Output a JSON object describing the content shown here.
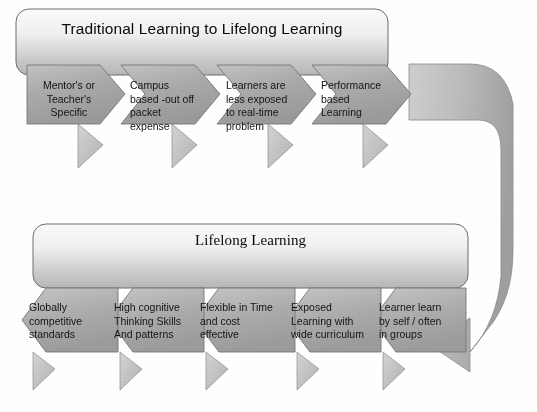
{
  "figure": {
    "kind": "process-diagram",
    "background_color": "#ffffff",
    "shape_fill_light": "#d8d8d8",
    "shape_fill_mid": "#a9a9a9",
    "shape_fill_dark": "#8f8f8f",
    "outline_color": "#6e6e6e",
    "text_color": "#141414"
  },
  "top_row": {
    "banner_title": "Traditional Learning to Lifelong Learning",
    "steps": [
      {
        "id": "step-1",
        "text": "Mentor's or\nTeacher's\nSpecific",
        "align": "center"
      },
      {
        "id": "step-2",
        "text": "Campus\nbased -out off\npacket\nexpense",
        "align": "left"
      },
      {
        "id": "step-3",
        "text": "Learners  are\nless exposed\nto real-time\nproblem",
        "align": "left"
      },
      {
        "id": "step-4",
        "text": "Performance\nbased\nLearning",
        "align": "left"
      }
    ]
  },
  "bottom_row": {
    "banner_title": "Lifelong Learning",
    "steps": [
      {
        "id": "step-1",
        "text": "Globally\ncompetitive\nstandards",
        "align": "left"
      },
      {
        "id": "step-2",
        "text": "High cognitive\nThinking Skills\nAnd patterns",
        "align": "left"
      },
      {
        "id": "step-3",
        "text": "Flexible in Time\nand cost\neffective",
        "align": "left"
      },
      {
        "id": "step-4",
        "text": "Exposed\nLearning with\nwide curriculum",
        "align": "left"
      },
      {
        "id": "step-5",
        "text": "Learner learn\nby self / often\nin groups",
        "align": "left"
      }
    ]
  },
  "connector": {
    "name": "u-turn-arrow",
    "description": "Large curved return arrow from end of top row down to end of bottom row, pointing left"
  }
}
